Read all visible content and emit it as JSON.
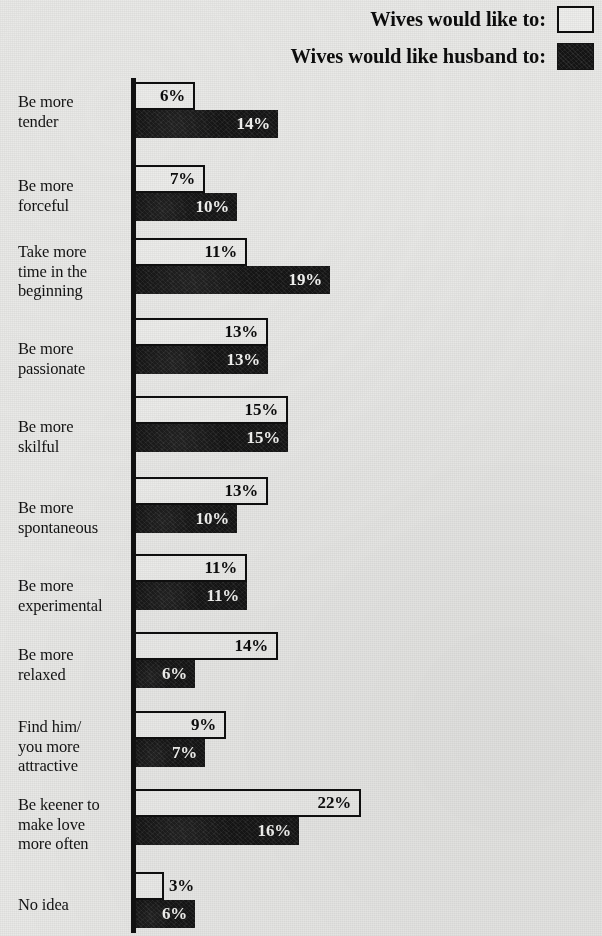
{
  "legend": {
    "items": [
      {
        "label": "Wives would like to:",
        "swatch": "open-square-icon",
        "style": "open"
      },
      {
        "label": "Wives would like husband to:",
        "swatch": "filled-square-icon",
        "style": "solid"
      }
    ]
  },
  "colors": {
    "background": "#e9e9e7",
    "ink": "#0d0d0d",
    "bar_open_fill": "#ececea",
    "bar_solid_fill": "#151515"
  },
  "chart_data": {
    "type": "bar",
    "orientation": "horizontal",
    "title": "",
    "subtitle": "",
    "xlabel": "",
    "ylabel": "",
    "grid": false,
    "legend_position": "top-right",
    "value_suffix": "%",
    "xlim": [
      0,
      22
    ],
    "categories": [
      "Be more tender",
      "Be more forceful",
      "Take more time in the beginning",
      "Be more passionate",
      "Be more skilful",
      "Be more spontaneous",
      "Be more experimental",
      "Be more relaxed",
      "Find him/you more attractive",
      "Be keener to make love more often",
      "No idea"
    ],
    "category_lines": [
      [
        "Be more",
        "tender"
      ],
      [
        "Be more",
        "forceful"
      ],
      [
        "Take more",
        "time in the",
        "beginning"
      ],
      [
        "Be more",
        "passionate"
      ],
      [
        "Be more",
        "skilful"
      ],
      [
        "Be more",
        "spontaneous"
      ],
      [
        "Be more",
        "experimental"
      ],
      [
        "Be more",
        "relaxed"
      ],
      [
        "Find him/",
        "you more",
        "attractive"
      ],
      [
        "Be keener to",
        "make love",
        "more often"
      ],
      [
        "No idea"
      ]
    ],
    "series": [
      {
        "name": "Wives would like to:",
        "style": "open",
        "values": [
          6,
          7,
          11,
          13,
          15,
          13,
          11,
          14,
          9,
          22,
          3
        ],
        "labels": [
          "6%",
          "7%",
          "11%",
          "13%",
          "15%",
          "13%",
          "11%",
          "14%",
          "9%",
          "22%",
          "3%"
        ]
      },
      {
        "name": "Wives would like husband to:",
        "style": "solid",
        "values": [
          14,
          10,
          19,
          13,
          15,
          10,
          11,
          6,
          7,
          16,
          6
        ],
        "labels": [
          "14%",
          "10%",
          "19%",
          "13%",
          "15%",
          "10%",
          "11%",
          "6%",
          "7%",
          "16%",
          "6%"
        ]
      }
    ]
  },
  "layout": {
    "axis_x": 133,
    "px_per_unit": 10.35,
    "bar_height": 28,
    "group_tops": [
      82,
      165,
      238,
      318,
      396,
      477,
      554,
      632,
      711,
      789,
      872
    ],
    "label_tops": [
      92,
      176,
      242,
      339,
      417,
      498,
      576,
      645,
      717,
      795,
      895
    ],
    "value_outside": [
      [
        10
      ],
      []
    ]
  }
}
